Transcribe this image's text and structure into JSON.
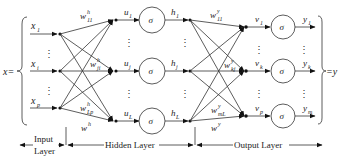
{
  "diagram": {
    "type": "feedforward-neural-network",
    "input_vector_label": "x=",
    "output_vector_label": "=y",
    "activation_symbol": "σ",
    "ellipsis": "⋮",
    "input_layer": {
      "nodes": [
        {
          "base": "x",
          "sub": "1"
        },
        {
          "base": "x",
          "sub": "i"
        },
        {
          "base": "x",
          "sub": "p"
        }
      ]
    },
    "hidden_layer": {
      "pre_activations": [
        {
          "base": "u",
          "sub": "1"
        },
        {
          "base": "u",
          "sub": "j"
        },
        {
          "base": "u",
          "sub": "L"
        }
      ],
      "outputs": [
        {
          "base": "h",
          "sub": "1"
        },
        {
          "base": "h",
          "sub": "j"
        },
        {
          "base": "h",
          "sub": "L"
        }
      ],
      "weights": [
        {
          "base": "w",
          "sup": "h",
          "sub": "11"
        },
        {
          "base": "w",
          "sup": "h",
          "sub": "ji"
        },
        {
          "base": "w",
          "sup": "h",
          "sub": "Lp"
        }
      ],
      "weight_matrix": {
        "base": "w",
        "sup": "h"
      }
    },
    "output_layer": {
      "pre_activations": [
        {
          "base": "v",
          "sub": "1"
        },
        {
          "base": "v",
          "sub": "k"
        },
        {
          "base": "v",
          "sub": "p"
        }
      ],
      "outputs": [
        {
          "base": "y",
          "sub": "1"
        },
        {
          "base": "y",
          "sub": "k"
        },
        {
          "base": "y",
          "sub": "m"
        }
      ],
      "weights": [
        {
          "base": "w",
          "sup": "y",
          "sub": "11"
        },
        {
          "base": "w",
          "sup": "y",
          "sub": "kj"
        },
        {
          "base": "w",
          "sup": "y",
          "sub": "mL"
        }
      ],
      "weight_matrix": {
        "base": "w",
        "sup": "y"
      }
    },
    "layer_labels": {
      "input_line1": "Input",
      "input_line2": "Layer",
      "hidden": "Hidden Layer",
      "output": "Output Layer"
    }
  }
}
